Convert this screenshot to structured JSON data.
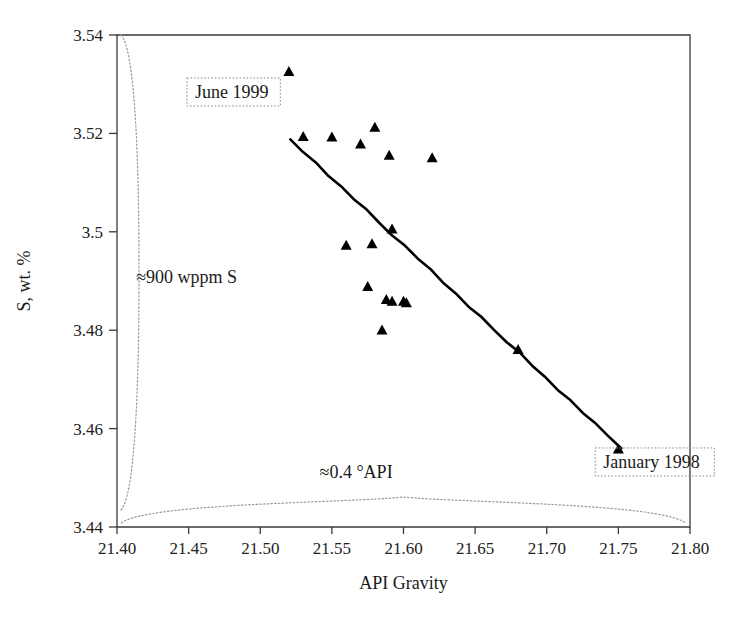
{
  "chart_data": {
    "type": "scatter",
    "title": "",
    "xlabel": "API Gravity",
    "ylabel": "S, wt. %",
    "xlim": [
      21.4,
      21.8
    ],
    "ylim": [
      3.44,
      3.54
    ],
    "xticks": [
      "21.40",
      "21.45",
      "21.50",
      "21.55",
      "21.60",
      "21.65",
      "21.70",
      "21.75",
      "21.80"
    ],
    "xtick_values": [
      21.4,
      21.45,
      21.5,
      21.55,
      21.6,
      21.65,
      21.7,
      21.75,
      21.8
    ],
    "yticks": [
      "3.44",
      "3.46",
      "3.48",
      "3.5",
      "3.52",
      "3.54"
    ],
    "ytick_values": [
      3.44,
      3.46,
      3.48,
      3.5,
      3.52,
      3.54
    ],
    "grid": false,
    "legend": "none",
    "marker_shape": "triangle-up",
    "marker_color": "#000000",
    "series": [
      {
        "name": "Crude assay points",
        "marker": "triangle-up",
        "x": [
          21.52,
          21.53,
          21.55,
          21.57,
          21.58,
          21.59,
          21.592,
          21.602,
          21.62,
          21.56,
          21.578,
          21.575,
          21.588,
          21.592,
          21.6,
          21.585,
          21.68,
          21.75
        ],
        "y": [
          3.5325,
          3.5193,
          3.5192,
          3.5178,
          3.5212,
          3.5155,
          3.5005,
          3.4855,
          3.515,
          3.4972,
          3.4975,
          3.4888,
          3.4862,
          3.4858,
          3.4858,
          3.48,
          3.476,
          3.4558
        ]
      }
    ],
    "trendline": {
      "name": "regression-line",
      "x_start": 21.521,
      "y_start": 3.5188,
      "x_end": 21.752,
      "y_end": 3.456,
      "color": "#000000"
    },
    "annotations": [
      {
        "id": "june-1999",
        "text": "June 1999",
        "boxed": true,
        "x": 21.453,
        "y": 3.5272
      },
      {
        "id": "january-1998",
        "text": "January 1998",
        "boxed": true,
        "x": 21.738,
        "y": 3.452
      },
      {
        "id": "range-s",
        "text": "≈900 wppm S",
        "boxed": false,
        "x": 21.412,
        "y": 3.4895
      },
      {
        "id": "range-api",
        "text": "≈0.4 °API",
        "boxed": false,
        "x": 21.54,
        "y": 3.45
      }
    ],
    "braces": [
      {
        "id": "y-range-brace",
        "orientation": "vertical",
        "from": 3.54,
        "to": 3.4435
      },
      {
        "id": "x-range-brace",
        "orientation": "horizontal",
        "from": 21.403,
        "to": 21.797
      }
    ]
  },
  "axes": {
    "x_title": "API Gravity",
    "y_title": "S, wt. %"
  },
  "annotations": {
    "june_1999": "June 1999",
    "january_1998": "January 1998",
    "sulfur_range": "≈900 wppm S",
    "api_range": "≈0.4 °API"
  },
  "colors": {
    "marker": "#000000",
    "trendline": "#000000",
    "axis": "#3a3a3a",
    "brace": "#9a9a9a",
    "background": "#ffffff"
  }
}
